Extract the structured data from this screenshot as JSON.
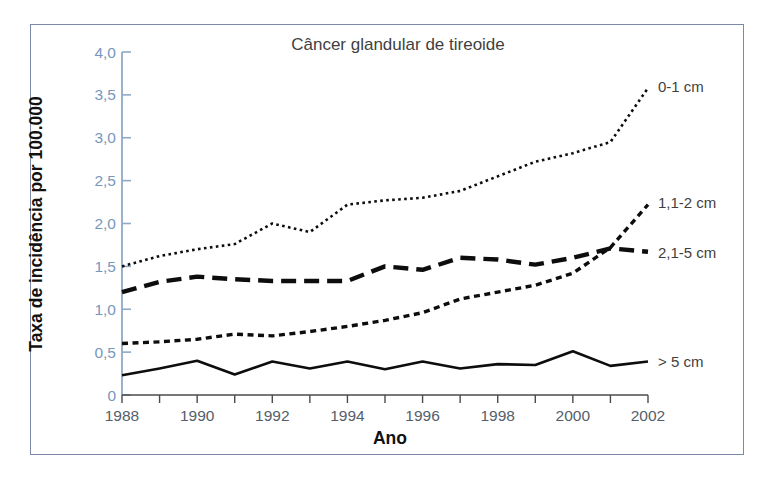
{
  "chart_data": {
    "type": "line",
    "title": "Câncer glandular de tireoide",
    "xlabel": "Ano",
    "ylabel": "Taxa de incidência por 100.000",
    "x": [
      1988,
      1989,
      1990,
      1991,
      1992,
      1993,
      1994,
      1995,
      1996,
      1997,
      1998,
      1999,
      2000,
      2001,
      2002
    ],
    "xlim": [
      1988,
      2002
    ],
    "ylim": [
      0,
      4.0
    ],
    "xtick_labels": [
      "1988",
      "1990",
      "1992",
      "1994",
      "1996",
      "1998",
      "2000",
      "2002"
    ],
    "xtick_values": [
      1988,
      1990,
      1992,
      1994,
      1996,
      1998,
      2000,
      2002
    ],
    "ytick_labels": [
      "0",
      "0,5",
      "1,0",
      "1,5",
      "2,0",
      "2,5",
      "3,0",
      "3,5",
      "4,0"
    ],
    "ytick_values": [
      0,
      0.5,
      1.0,
      1.5,
      2.0,
      2.5,
      3.0,
      3.5,
      4.0
    ],
    "grid": false,
    "legend_position": "right-inline-end-of-line",
    "series": [
      {
        "name": "0-1 cm",
        "style": "dotted",
        "color": "#0d0d0d",
        "values": [
          1.5,
          1.62,
          1.7,
          1.76,
          2.0,
          1.9,
          2.22,
          2.27,
          2.3,
          2.38,
          2.55,
          2.72,
          2.82,
          2.95,
          3.58
        ]
      },
      {
        "name": "1,1-2 cm",
        "style": "short-dash",
        "color": "#0d0d0d",
        "values": [
          0.6,
          0.62,
          0.65,
          0.71,
          0.69,
          0.74,
          0.8,
          0.87,
          0.96,
          1.12,
          1.2,
          1.28,
          1.42,
          1.72,
          2.22
        ]
      },
      {
        "name": "2,1-5 cm",
        "style": "long-dash",
        "color": "#0d0d0d",
        "values": [
          1.2,
          1.32,
          1.38,
          1.35,
          1.33,
          1.33,
          1.33,
          1.5,
          1.46,
          1.6,
          1.58,
          1.52,
          1.6,
          1.71,
          1.67
        ]
      },
      {
        "name": "> 5 cm",
        "style": "solid",
        "color": "#0d0d0d",
        "values": [
          0.23,
          0.31,
          0.4,
          0.24,
          0.39,
          0.31,
          0.39,
          0.3,
          0.39,
          0.31,
          0.36,
          0.35,
          0.51,
          0.34,
          0.39
        ]
      }
    ]
  },
  "colors": {
    "frame_border": "#7d87a8",
    "y_axis": "#8fa9c6",
    "y_tick_label": "#7897bc",
    "x_tick_label": "#555e6b",
    "line": "#0d0d0d",
    "title_text": "#3f3f3f",
    "axis_title": "#111111",
    "background": "#ffffff"
  }
}
